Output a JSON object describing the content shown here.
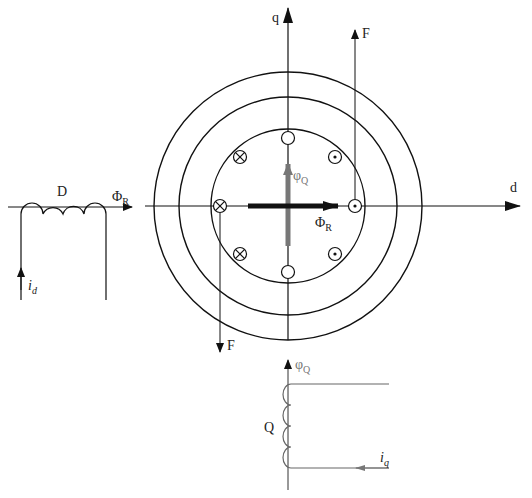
{
  "diagram": {
    "type": "machine-cross-section",
    "axes": {
      "d_label": "d",
      "q_label": "q"
    },
    "colors": {
      "line": "#111111",
      "gray_arrow": "#777777",
      "gray_coil": "#666666"
    },
    "rotor": {
      "circles": [
        "outer",
        "middle",
        "inner"
      ],
      "conductors": [
        {
          "position": "top",
          "symbol": "empty"
        },
        {
          "position": "upper-left",
          "symbol": "cross"
        },
        {
          "position": "upper-right",
          "symbol": "dot"
        },
        {
          "position": "left",
          "symbol": "cross"
        },
        {
          "position": "right",
          "symbol": "dot"
        },
        {
          "position": "lower-left",
          "symbol": "cross"
        },
        {
          "position": "lower-right",
          "symbol": "dot"
        },
        {
          "position": "bottom",
          "symbol": "empty"
        }
      ]
    },
    "labels": {
      "phi_R_main": "Φ",
      "phi_R_main_sub": "R",
      "phi_Q_main": "φ",
      "phi_Q_main_sub": "Q",
      "force_top": "F",
      "force_bottom": "F"
    },
    "d_coil": {
      "name": "D",
      "flux_label": "Φ",
      "flux_sub": "R",
      "current_label": "i",
      "current_sub": "d"
    },
    "q_coil": {
      "name": "Q",
      "flux_label": "φ",
      "flux_sub": "Q",
      "current_label": "i",
      "current_sub": "q"
    }
  }
}
